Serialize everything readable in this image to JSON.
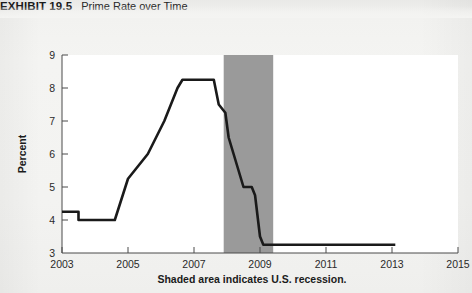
{
  "exhibit": {
    "number": "EXHIBIT 19.5",
    "title": "Prime Rate over Time"
  },
  "chart_data": {
    "type": "line",
    "title": "Prime Rate over Time",
    "xlabel": "",
    "ylabel": "Percent",
    "xlim": [
      2003,
      2015
    ],
    "ylim": [
      3,
      9
    ],
    "xticks": [
      "2003",
      "2005",
      "2007",
      "2009",
      "2011",
      "2013",
      "2015"
    ],
    "xtick_values": [
      2003,
      2005,
      2007,
      2009,
      2011,
      2013,
      2015
    ],
    "yticks": [
      "3",
      "4",
      "5",
      "6",
      "7",
      "8",
      "9"
    ],
    "ytick_values": [
      3,
      4,
      5,
      6,
      7,
      8,
      9
    ],
    "grid": false,
    "legend": null,
    "line_color": "#1a1a1a",
    "series": [
      {
        "name": "Prime Rate",
        "x": [
          2003.0,
          2003.5,
          2003.5,
          2004.6,
          2005.0,
          2005.6,
          2006.1,
          2006.5,
          2006.65,
          2007.6,
          2007.75,
          2007.95,
          2008.05,
          2008.2,
          2008.35,
          2008.5,
          2008.75,
          2008.85,
          2009.0,
          2009.1,
          2013.1
        ],
        "values": [
          4.25,
          4.25,
          4.0,
          4.0,
          5.25,
          6.0,
          7.0,
          8.0,
          8.25,
          8.25,
          7.5,
          7.25,
          6.5,
          6.0,
          5.5,
          5.0,
          5.0,
          4.75,
          3.5,
          3.25,
          3.25
        ]
      }
    ],
    "annotations": [
      {
        "type": "shaded-band",
        "label": "U.S. recession",
        "x_start": 2007.9,
        "x_end": 2009.4,
        "color": "#9a9a9a"
      }
    ],
    "caption": "Shaded area indicates U.S. recession."
  }
}
